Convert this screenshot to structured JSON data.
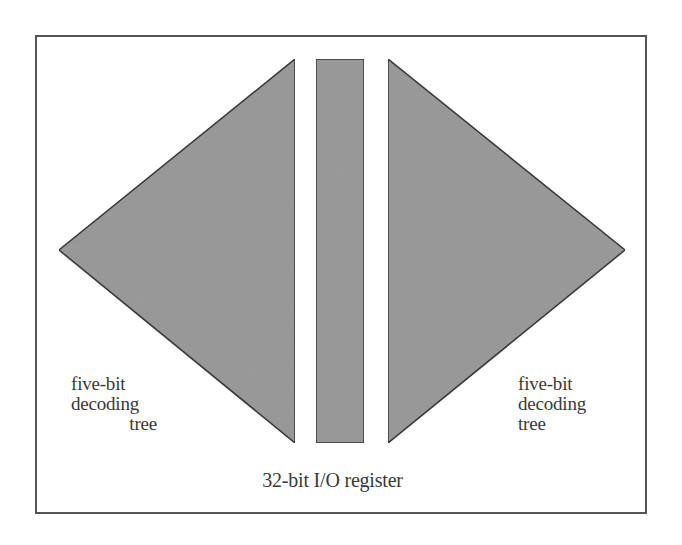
{
  "diagram": {
    "frame": {
      "x": 36,
      "y": 36,
      "width": 610,
      "height": 477,
      "stroke": "#555555"
    },
    "colors": {
      "fill": "#9b9b9b",
      "stroke": "#3c3c3c",
      "text": "#3a3a3a",
      "background": "#ffffff"
    },
    "left_tree": {
      "shape": "triangle",
      "points": [
        [
          295,
          59
        ],
        [
          59,
          250
        ],
        [
          295,
          443
        ]
      ]
    },
    "register": {
      "shape": "rect",
      "x": 316,
      "y": 59,
      "width": 48,
      "height": 384
    },
    "right_tree": {
      "shape": "triangle",
      "points": [
        [
          388,
          59
        ],
        [
          625,
          250
        ],
        [
          388,
          443
        ]
      ]
    },
    "labels": {
      "left_tree": {
        "line1": "five-bit",
        "line2": "decoding",
        "line3": "tree"
      },
      "right_tree": {
        "line1": "five-bit",
        "line2": "decoding",
        "line3": "tree"
      },
      "register": "32-bit I/O register"
    }
  }
}
